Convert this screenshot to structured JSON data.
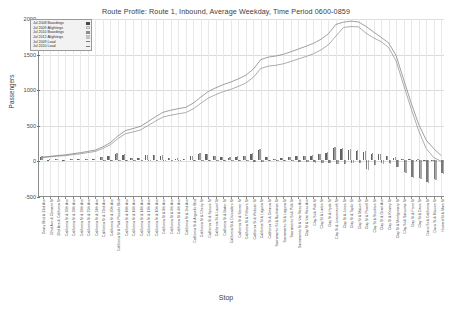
{
  "chart": {
    "title": "Route Profile: Route 1, Inbound, Average Weekday, Time Period 0600-0859",
    "xlabel": "Stop",
    "ylabel": "Passengers"
  },
  "legend": {
    "items": [
      {
        "label": "Jul 2008 Boardings",
        "key": "sw-dark"
      },
      {
        "label": "Jul 2009 Alightings",
        "key": "sw-pale"
      },
      {
        "label": "Jul 2010 Boardings",
        "key": "sw-mid"
      },
      {
        "label": "Jul 2012 Alightings",
        "key": "sw-light"
      },
      {
        "label": "Jul 2009 Load",
        "key": "line"
      },
      {
        "label": "Jul 2010 Load",
        "key": "line"
      }
    ]
  },
  "chart_data": {
    "type": "bar",
    "title": "Route Profile: Route 1, Inbound, Average Weekday, Time Period 0600-0859",
    "xlabel": "Stop",
    "ylabel": "Passengers",
    "ylim": [
      -500,
      2000
    ],
    "yticks": [
      2000,
      1500,
      1000,
      500,
      0,
      -500
    ],
    "ytick_labels": [
      "2000",
      "1500",
      "1000",
      "500",
      "0",
      "-500"
    ],
    "grid": true,
    "legend_position": "top-left",
    "categories": [
      "Geary Blvd & 33rd Ave",
      "32nd Ave & Clement St",
      "33rd Ave & California St",
      "California St & 30th Ave",
      "California St & 28th Ave",
      "California St & 26th Ave",
      "California St & 25th Ave",
      "California St & 24th Ave",
      "California St & 22nd Ave",
      "California St & 20th Ave",
      "California St & Park Presidio Blvd",
      "California St & 18th Ave",
      "California St & 16th Ave",
      "California St & 14th Ave",
      "California St & 12th Ave",
      "California St & 10th Ave",
      "California St & 8th Ave",
      "California St & 6th Ave",
      "California St & 4th Ave",
      "California St & 2nd Ave",
      "California St & Arguello Blvd",
      "California St & Cherry St",
      "California St & Spruce St",
      "California St & Laurel St",
      "California St & Baker St",
      "California St & Divisadero St",
      "California St & Steiner St",
      "California St & Fillmore St",
      "California St & Webster St",
      "California St & Laguna St",
      "California St & Octavia St",
      "Sacramento St & Buchanan St",
      "Sacramento St & Laguna St",
      "Sacramento St & Polk St",
      "Sacramento St & Van Ness Ave",
      "Clay St & Van Ness Ave",
      "Clay St & Polk St",
      "Clay St & Larkin St",
      "Clay St & Hyde St",
      "Clay St & Leavenworth St",
      "Clay St & Jones St",
      "Clay St & Taylor St",
      "Clay St & Mason St",
      "Clay St & Powell St",
      "Clay St & Stockton St",
      "Clay St & Grant Ave",
      "Clay St & Kearny St",
      "Clay St & Montgomery St",
      "Clay St & Sansome St",
      "Clay St & Front St",
      "Clay St & Davis St",
      "Davis St & California St",
      "Davis St & Mission St",
      "Howard St & Main St"
    ],
    "series": [
      {
        "name": "Jul 2008 Boardings",
        "type": "bar",
        "values": [
          55,
          12,
          14,
          10,
          18,
          16,
          22,
          20,
          48,
          60,
          95,
          78,
          30,
          36,
          70,
          72,
          66,
          30,
          26,
          22,
          62,
          92,
          86,
          58,
          50,
          40,
          52,
          58,
          96,
          150,
          42,
          18,
          30,
          46,
          62,
          56,
          66,
          84,
          110,
          170,
          165,
          150,
          130,
          120,
          96,
          86,
          60,
          40,
          20,
          16,
          12,
          8,
          6,
          4
        ]
      },
      {
        "name": "Jul 2010 Boardings",
        "type": "bar",
        "values": [
          60,
          14,
          16,
          12,
          20,
          18,
          24,
          22,
          52,
          66,
          104,
          84,
          34,
          40,
          76,
          78,
          70,
          34,
          28,
          24,
          68,
          98,
          92,
          62,
          54,
          44,
          56,
          62,
          104,
          160,
          46,
          22,
          34,
          50,
          68,
          62,
          72,
          90,
          118,
          182,
          176,
          160,
          140,
          128,
          102,
          92,
          64,
          44,
          22,
          18,
          14,
          10,
          7,
          5
        ]
      },
      {
        "name": "Jul 2009 Alightings",
        "type": "bar",
        "values": [
          0,
          -3,
          -4,
          -3,
          -4,
          -4,
          -5,
          -4,
          -6,
          -7,
          -10,
          -9,
          -6,
          -7,
          -9,
          -9,
          -8,
          -6,
          -6,
          -5,
          -10,
          -14,
          -12,
          -9,
          -9,
          -8,
          -10,
          -11,
          -16,
          -24,
          -10,
          -6,
          -9,
          -14,
          -26,
          -22,
          -28,
          -30,
          -36,
          -48,
          -44,
          -38,
          -34,
          -120,
          -60,
          -40,
          -42,
          -90,
          -160,
          -230,
          -240,
          -300,
          -255,
          -180
        ]
      },
      {
        "name": "Jul 2012 Alightings",
        "type": "bar",
        "values": [
          0,
          -3,
          -4,
          -3,
          -5,
          -4,
          -5,
          -5,
          -7,
          -8,
          -11,
          -10,
          -6,
          -8,
          -10,
          -10,
          -9,
          -6,
          -6,
          -5,
          -11,
          -15,
          -13,
          -10,
          -10,
          -9,
          -11,
          -12,
          -18,
          -26,
          -11,
          -7,
          -10,
          -15,
          -28,
          -24,
          -30,
          -33,
          -40,
          -52,
          -48,
          -42,
          -37,
          -130,
          -65,
          -44,
          -46,
          -98,
          -172,
          -248,
          -260,
          -320,
          -272,
          -195
        ]
      },
      {
        "name": "Jul 2009 Load",
        "type": "line",
        "values": [
          55,
          64,
          74,
          81,
          95,
          107,
          124,
          140,
          182,
          235,
          320,
          389,
          413,
          442,
          503,
          566,
          624,
          648,
          668,
          685,
          737,
          815,
          889,
          938,
          979,
          1011,
          1053,
          1100,
          1180,
          1306,
          1338,
          1350,
          1371,
          1403,
          1439,
          1473,
          1511,
          1565,
          1639,
          1761,
          1882,
          1894,
          1890,
          1800,
          1736,
          1682,
          1600,
          1410,
          1070,
          740,
          430,
          180,
          55,
          0
        ]
      },
      {
        "name": "Jul 2010 Load",
        "type": "line",
        "values": [
          60,
          71,
          83,
          92,
          108,
          122,
          141,
          159,
          205,
          264,
          358,
          433,
          461,
          493,
          559,
          628,
          690,
          718,
          740,
          759,
          817,
          901,
          981,
          1033,
          1078,
          1114,
          1159,
          1209,
          1295,
          1429,
          1465,
          1480,
          1504,
          1540,
          1578,
          1616,
          1658,
          1715,
          1793,
          1925,
          1955,
          1970,
          1958,
          1896,
          1818,
          1742,
          1665,
          1486,
          1150,
          820,
          520,
          300,
          180,
          80
        ]
      }
    ]
  }
}
